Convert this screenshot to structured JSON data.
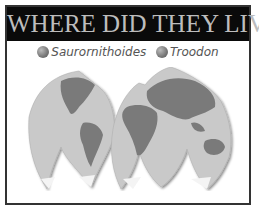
{
  "banner": {
    "title": "WHERE DID THEY LIVE?"
  },
  "legend": {
    "items": [
      {
        "label": "Saurornithoides",
        "color": "#888888"
      },
      {
        "label": "Troodon",
        "color": "#888888"
      }
    ]
  },
  "map": {
    "description": "Interrupted world map projection (grayscale)"
  }
}
